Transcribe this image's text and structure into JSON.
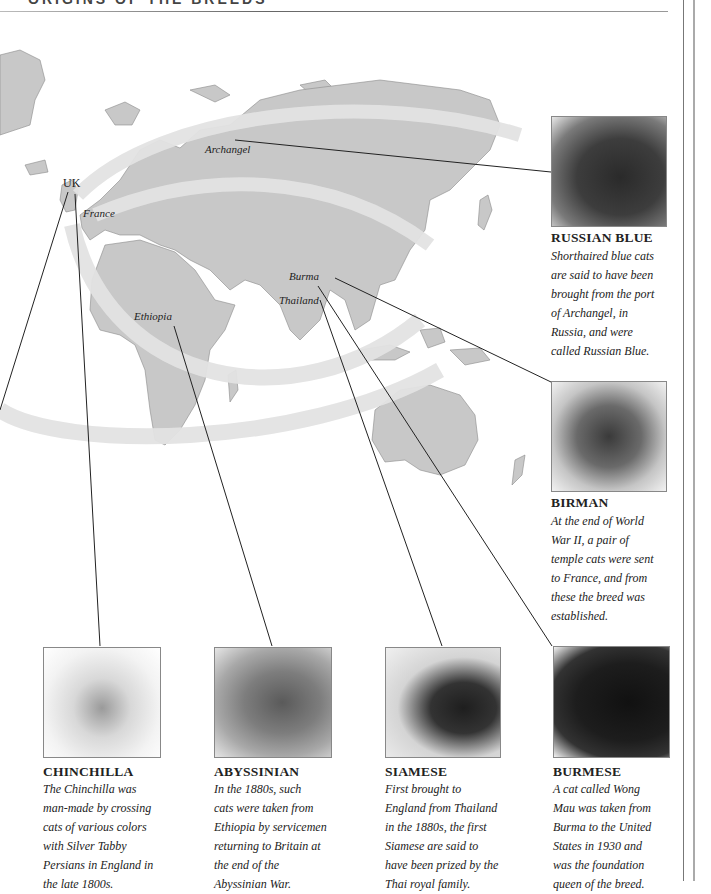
{
  "header": {
    "title": "ORIGINS OF THE BREEDS"
  },
  "map": {
    "colors": {
      "land": "#c8c8c8",
      "arrow": "#e3e3e3",
      "line": "#222222"
    },
    "labels": {
      "uk": "UK",
      "france": "France",
      "archangel": "Archangel",
      "burma": "Burma",
      "thailand": "Thailand",
      "ethiopia": "Ethiopia"
    }
  },
  "breeds": [
    {
      "id": "russian-blue",
      "name": "RUSSIAN BLUE",
      "lines": [
        "Shorthaired blue cats",
        "are said to have been",
        "brought from the port",
        "of Archangel, in",
        "Russia, and were",
        "called Russian Blue."
      ]
    },
    {
      "id": "birman",
      "name": "BIRMAN",
      "lines": [
        "At the end of World",
        "War II, a pair of",
        "temple cats were sent",
        "to France, and from",
        "these the breed was",
        "established."
      ]
    },
    {
      "id": "chinchilla",
      "name": "CHINCHILLA",
      "lines": [
        "The Chinchilla was",
        "man-made by crossing",
        "cats of various colors",
        "with Silver Tabby",
        "Persians in England in",
        "the late 1800s."
      ]
    },
    {
      "id": "abyssinian",
      "name": "ABYSSINIAN",
      "lines": [
        "In the 1880s, such",
        "cats were taken from",
        "Ethiopia by servicemen",
        "returning to Britain at",
        "the end of the",
        "Abyssinian War."
      ]
    },
    {
      "id": "siamese",
      "name": "SIAMESE",
      "lines": [
        "First brought to",
        "England from Thailand",
        "in the 1880s, the first",
        "Siamese are said to",
        "have been prized by the",
        "Thai royal family."
      ]
    },
    {
      "id": "burmese",
      "name": "BURMESE",
      "lines": [
        "A cat called Wong",
        "Mau was taken from",
        "Burma to the United",
        "States in 1930 and",
        "was the foundation",
        "queen of the breed."
      ]
    }
  ]
}
